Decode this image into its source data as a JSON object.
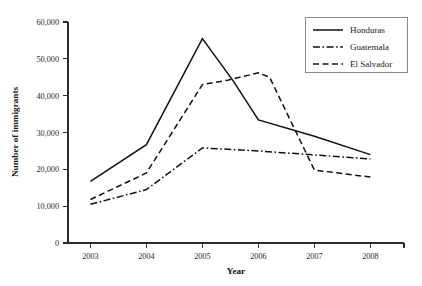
{
  "chart_data": {
    "type": "line",
    "title": "",
    "xlabel": "Year",
    "ylabel": "Number of immigrants",
    "categories": [
      "2003",
      "2004",
      "2005",
      "2006",
      "2007",
      "2008"
    ],
    "x": [
      2003,
      2004,
      2005,
      2006,
      2007,
      2008
    ],
    "xlim": [
      2002.6,
      2008.6
    ],
    "ylim": [
      0,
      60000
    ],
    "yticks": [
      0,
      10000,
      20000,
      30000,
      40000,
      50000,
      60000
    ],
    "ytick_labels": [
      "0",
      "10,000",
      "20,000",
      "30,000",
      "40,000",
      "50,000",
      "60,000"
    ],
    "xtick_labels": [
      "2003",
      "2004",
      "2005",
      "2006",
      "2007",
      "2008"
    ],
    "grid": false,
    "legend_position": "top-right",
    "series": [
      {
        "name": "Honduras",
        "style": "solid",
        "values": [
          16700,
          26700,
          55500,
          33400,
          29000,
          24000
        ],
        "vertices": [
          {
            "x": 2003,
            "y": 16700
          },
          {
            "x": 2004,
            "y": 26700
          },
          {
            "x": 2005,
            "y": 55500
          },
          {
            "x": 2005.55,
            "y": 44000
          },
          {
            "x": 2006,
            "y": 33400
          },
          {
            "x": 2007,
            "y": 29000
          },
          {
            "x": 2008,
            "y": 24000
          }
        ]
      },
      {
        "name": "Guatemala",
        "style": "dash-dot",
        "values": [
          10500,
          14500,
          25800,
          25000,
          23900,
          22800
        ],
        "vertices": [
          {
            "x": 2003,
            "y": 10500
          },
          {
            "x": 2004,
            "y": 14500
          },
          {
            "x": 2005,
            "y": 25800
          },
          {
            "x": 2006,
            "y": 25000
          },
          {
            "x": 2007,
            "y": 23900
          },
          {
            "x": 2008,
            "y": 22800
          }
        ]
      },
      {
        "name": "El Salvador",
        "style": "dashed",
        "values": [
          11800,
          19000,
          43000,
          46200,
          19800,
          17900
        ],
        "vertices": [
          {
            "x": 2003,
            "y": 11800
          },
          {
            "x": 2004,
            "y": 19000
          },
          {
            "x": 2005,
            "y": 43000
          },
          {
            "x": 2005.45,
            "y": 44200
          },
          {
            "x": 2006,
            "y": 46200
          },
          {
            "x": 2006.2,
            "y": 45000
          },
          {
            "x": 2007,
            "y": 19800
          },
          {
            "x": 2008,
            "y": 17900
          }
        ]
      }
    ]
  },
  "legend": {
    "entries": [
      {
        "label": "Honduras",
        "style": "solid"
      },
      {
        "label": "Guatemala",
        "style": "dash-dot"
      },
      {
        "label": "El Salvador",
        "style": "dashed"
      }
    ]
  },
  "colors": {
    "line": "#111111",
    "axis": "#2b2b2b",
    "legend_border": "#8a8a8a",
    "background": "#ffffff",
    "text": "#1a1a1a"
  }
}
